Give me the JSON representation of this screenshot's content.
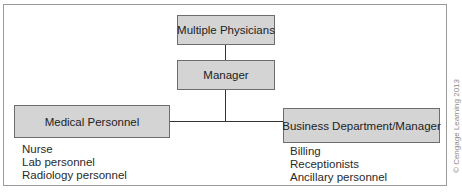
{
  "diagram": {
    "type": "org-chart",
    "nodes": {
      "physicians": {
        "label": "Multiple Physicians"
      },
      "manager": {
        "label": "Manager"
      },
      "medical": {
        "label": "Medical Personnel"
      },
      "business": {
        "label": "Business Department/Manager"
      }
    },
    "edges": [
      {
        "from": "Multiple Physicians",
        "to": "Manager"
      },
      {
        "from": "Manager",
        "to": "Medical Personnel"
      },
      {
        "from": "Manager",
        "to": "Business Department/Manager"
      }
    ],
    "medical_staff": [
      "Nurse",
      "Lab personnel",
      "Radiology personnel"
    ],
    "business_staff": [
      "Billing",
      "Receptionists",
      "Ancillary personnel"
    ],
    "colors": {
      "box_fill": "#d4d4d4",
      "box_border": "#6d6d6d",
      "line": "#333333",
      "frame": "#9a9a9a"
    }
  },
  "credit": "© Cengage Learning 2013"
}
